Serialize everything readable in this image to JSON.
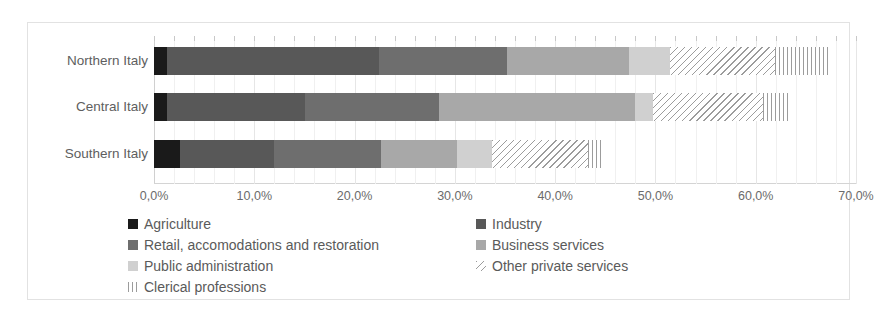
{
  "chart_data": {
    "type": "bar",
    "orientation": "horizontal",
    "stacked": true,
    "title": "",
    "xlabel": "",
    "ylabel": "",
    "xlim": [
      0,
      70
    ],
    "xticks": [
      0,
      10,
      20,
      30,
      40,
      50,
      60,
      70
    ],
    "xtick_labels": [
      "0,0%",
      "10,0%",
      "20,0%",
      "30,0%",
      "40,0%",
      "50,0%",
      "60,0%",
      "70,0%"
    ],
    "minor_ticks_per_interval": 5,
    "grid": true,
    "legend_position": "bottom",
    "categories": [
      "Northern Italy",
      "Central Italy",
      "Southern Italy"
    ],
    "series": [
      {
        "name": "Agriculture",
        "color": "#1a1a1a",
        "pattern": "solid",
        "values": [
          1.3,
          1.3,
          2.6
        ]
      },
      {
        "name": "Industry",
        "color": "#585858",
        "pattern": "solid",
        "values": [
          21.1,
          13.8,
          9.4
        ]
      },
      {
        "name": "Retail, accomodations and restoration",
        "color": "#6e6e6e",
        "pattern": "solid",
        "values": [
          12.8,
          13.3,
          10.6
        ]
      },
      {
        "name": "Business services",
        "color": "#a8a8a8",
        "pattern": "solid",
        "values": [
          12.2,
          19.6,
          7.6
        ]
      },
      {
        "name": "Public administration",
        "color": "#d0d0d0",
        "pattern": "solid",
        "values": [
          4.1,
          1.8,
          3.5
        ]
      },
      {
        "name": "Other private services",
        "color": "#9c9c9c",
        "pattern": "diagonal-hatch",
        "values": [
          10.4,
          10.9,
          9.6
        ]
      },
      {
        "name": "Clerical professions",
        "color": "#9c9c9c",
        "pattern": "vertical-hatch",
        "values": [
          5.5,
          2.8,
          1.4
        ]
      }
    ],
    "totals": [
      67.4,
      63.5,
      44.7
    ]
  },
  "legend": {
    "left_column": [
      "Agriculture",
      "Retail, accomodations and restoration",
      "Public administration",
      "Clerical professions"
    ],
    "right_column": [
      "Industry",
      "Business services",
      "Other private services"
    ]
  },
  "colors": {
    "agriculture": "#1a1a1a",
    "industry": "#585858",
    "retail": "#6e6e6e",
    "business_services": "#a8a8a8",
    "public_administration": "#d0d0d0",
    "other_private_services": "#9c9c9c",
    "clerical_professions": "#9c9c9c",
    "grid": "#e6e6e6",
    "text": "#5a5a5a",
    "frame": "#e2e2e2"
  }
}
